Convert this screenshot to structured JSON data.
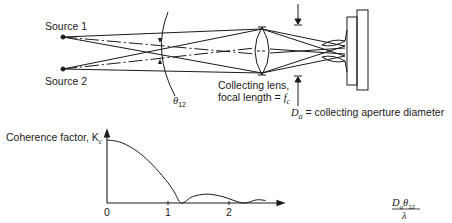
{
  "diagram": {
    "source1_label": "Source 1",
    "source2_label": "Source 2",
    "angle_label": "θ",
    "angle_sub": "12",
    "lens_label_line1": "Collecting lens,",
    "lens_label_line2": "focal length = ",
    "lens_f": "f",
    "lens_f_sub": "c",
    "aperture_D": "D",
    "aperture_sub": "a",
    "aperture_text": " = collecting aperture diameter"
  },
  "chart_data": {
    "type": "line",
    "title": "",
    "ylabel": "Coherence factor, K",
    "ylabel_sub": "c",
    "xlabel_num_D": "D",
    "xlabel_num_sub": "a",
    "xlabel_num_theta": "θ",
    "xlabel_num_theta_sub": "12",
    "xlabel_den": "λ",
    "x_ticks": [
      "0",
      "1",
      "2"
    ],
    "x_tick_values": [
      0,
      1,
      2
    ],
    "xlim": [
      0,
      2.9
    ],
    "ylim": [
      0,
      1.1
    ],
    "series": [
      {
        "name": "Kc",
        "x": [
          0,
          0.2,
          0.4,
          0.6,
          0.8,
          1.0,
          1.1,
          1.22,
          1.4,
          1.64,
          1.9,
          2.23,
          2.45,
          2.6
        ],
        "y": [
          1.0,
          0.97,
          0.88,
          0.74,
          0.55,
          0.32,
          0.18,
          0.0,
          0.1,
          0.14,
          0.1,
          0.0,
          0.05,
          0.04
        ]
      }
    ]
  }
}
